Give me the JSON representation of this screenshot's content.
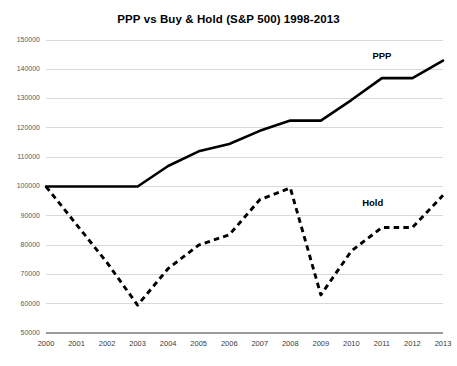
{
  "chart_data": {
    "type": "line",
    "title": "PPP vs Buy & Hold (S&P 500) 1998-2013",
    "xlabel": "",
    "ylabel": "",
    "x": [
      2000,
      2001,
      2002,
      2003,
      2004,
      2005,
      2006,
      2007,
      2008,
      2009,
      2010,
      2011,
      2012,
      2013
    ],
    "categories": [
      "2000",
      "2001",
      "2002",
      "2003",
      "2004",
      "2005",
      "2006",
      "2007",
      "2008",
      "2009",
      "2010",
      "2011",
      "2012",
      "2013"
    ],
    "xlim": [
      2000,
      2013
    ],
    "ylim": [
      50000,
      150000
    ],
    "yticks": [
      50000,
      60000,
      70000,
      80000,
      90000,
      100000,
      110000,
      120000,
      130000,
      140000,
      150000
    ],
    "ytick_labels": [
      "50000",
      "60000",
      "70000",
      "80000",
      "90000",
      "100000",
      "110000",
      "120000",
      "130000",
      "140000",
      "150000"
    ],
    "xticks": [
      2000,
      2001,
      2002,
      2003,
      2004,
      2005,
      2006,
      2007,
      2008,
      2009,
      2010,
      2011,
      2012,
      2013
    ],
    "xtick_labels": [
      "2000",
      "2001",
      "2002",
      "2003",
      "2004",
      "2005",
      "2006",
      "2007",
      "2008",
      "2009",
      "2010",
      "2011",
      "2012",
      "2013"
    ],
    "grid": true,
    "grid_axis": "y",
    "legend_position": "inline-annotation",
    "series": [
      {
        "name": "PPP",
        "style": "solid",
        "color": "#000000",
        "label_x": 2011.0,
        "label_y": 143500,
        "values": [
          100000,
          100000,
          100000,
          100000,
          107000,
          112000,
          114500,
          119000,
          122500,
          122500,
          129500,
          137000,
          137000,
          143000
        ]
      },
      {
        "name": "Hold",
        "style": "dashed",
        "color": "#000000",
        "label_x": 2010.7,
        "label_y": 93500,
        "values": [
          100000,
          87000,
          74000,
          59500,
          72000,
          80000,
          83500,
          95500,
          99500,
          63000,
          78000,
          86000,
          86000,
          97000
        ]
      }
    ],
    "annotations": [
      {
        "text": "PPP",
        "series": "PPP"
      },
      {
        "text": "Hold",
        "series": "Hold"
      }
    ]
  },
  "colors": {
    "background": "#ffffff",
    "gridline": "#d9d9dc",
    "axis": "#9b9b9e",
    "series": "#000000",
    "title_text": "#000000",
    "tick_text": "#59595b"
  }
}
